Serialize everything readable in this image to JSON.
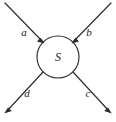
{
  "figure": {
    "type": "scattering-diagram",
    "background_color": "#ffffff",
    "stroke_color": "#2b2b2b",
    "text_color": "#1a1a1a"
  },
  "node": {
    "label": "S",
    "shape": "circle",
    "center_x": 58,
    "center_y": 57,
    "radius": 21
  },
  "edges": [
    {
      "id": "edge-a",
      "label": "a",
      "direction": "incoming",
      "orientation": "top-left",
      "label_x": 24,
      "label_y": 33,
      "start_x": 5,
      "start_y": 3,
      "end_x": 43.2,
      "end_y": 42.2
    },
    {
      "id": "edge-b",
      "label": "b",
      "direction": "incoming",
      "orientation": "top-right",
      "label_x": 89,
      "label_y": 33,
      "start_x": 111,
      "start_y": 3,
      "end_x": 72.8,
      "end_y": 42.2
    },
    {
      "id": "edge-d",
      "label": "d",
      "direction": "outgoing",
      "orientation": "bottom-left",
      "label_x": 27,
      "label_y": 94,
      "start_x": 43.2,
      "start_y": 71.8,
      "end_x": 5,
      "end_y": 113
    },
    {
      "id": "edge-c",
      "label": "c",
      "direction": "outgoing",
      "orientation": "bottom-right",
      "label_x": 88,
      "label_y": 94,
      "start_x": 72.8,
      "start_y": 71.8,
      "end_x": 111,
      "end_y": 113
    }
  ]
}
